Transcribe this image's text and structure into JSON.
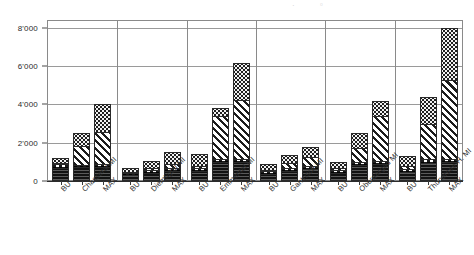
{
  "chart_data": {
    "type": "bar",
    "title": "",
    "subtitle": "",
    "xlabel": "",
    "ylabel": "",
    "ylim": [
      0,
      8400
    ],
    "grid": true,
    "stacked": true,
    "legend_position": "none",
    "yticks": [
      0,
      2000,
      4000,
      6000,
      8000
    ],
    "ytick_labels": [
      "0",
      "2'000",
      "4'000",
      "6'000",
      "8'000"
    ],
    "groups": [
      "Chasseral MI",
      "Diemtigtal MI",
      "Emmental MI",
      "Gantrisch MI",
      "Oberaargau MI",
      "Thunersee-H. MI"
    ],
    "bars_per_group": [
      "BU",
      "MI",
      "MAX"
    ],
    "categories": [
      "BU",
      "Chasseral MI",
      "MAX",
      "BU",
      "Diemtigtal MI",
      "MAX",
      "BU",
      "Emmental MI",
      "MAX",
      "BU",
      "Gantrisch MI",
      "MAX",
      "BU",
      "Oberaargau MI",
      "MAX",
      "BU",
      "Thunersee-H. MI",
      "MAX"
    ],
    "series": [
      {
        "name": "segment-solid",
        "pattern": "solid-dark",
        "values": [
          620,
          650,
          660,
          250,
          350,
          430,
          480,
          900,
          900,
          330,
          480,
          560,
          380,
          780,
          800,
          430,
          880,
          900
        ]
      },
      {
        "name": "segment-dashed",
        "pattern": "dashed",
        "values": [
          220,
          120,
          120,
          110,
          170,
          180,
          150,
          150,
          160,
          140,
          150,
          170,
          150,
          170,
          180,
          160,
          180,
          180
        ]
      },
      {
        "name": "segment-diagonal",
        "pattern": "diagonal-hatch",
        "values": [
          80,
          1050,
          1720,
          60,
          140,
          250,
          120,
          2320,
          3120,
          70,
          260,
          480,
          110,
          740,
          2390,
          150,
          1860,
          4140
        ]
      },
      {
        "name": "segment-dotted",
        "pattern": "dotted",
        "values": [
          290,
          680,
          1500,
          240,
          390,
          640,
          640,
          430,
          1990,
          360,
          460,
          560,
          370,
          800,
          830,
          560,
          1480,
          2780
        ]
      }
    ],
    "totals": [
      1210,
      2500,
      4000,
      660,
      1050,
      1500,
      1390,
      3800,
      6170,
      900,
      1350,
      1770,
      1010,
      2490,
      4200,
      1300,
      4400,
      8000
    ]
  },
  "axis": {
    "y_tick_labels": [
      "8'000",
      "6'000",
      "4'000",
      "2'000",
      "0"
    ],
    "x_tick_labels": [
      "BU",
      "Chasseral MI",
      "MAX",
      "BU",
      "Diemtigtal MI",
      "MAX",
      "BU",
      "Emmental MI",
      "MAX",
      "BU",
      "Gantrisch MI",
      "MAX",
      "BU",
      "Oberaargau MI",
      "MAX",
      "BU",
      "Thunersee-H. MI",
      "MAX"
    ]
  },
  "colors": {
    "ink": "#1c1c1c",
    "grid": "#9a9a9a",
    "frame": "#8a8a8a",
    "background": "#ffffff"
  }
}
